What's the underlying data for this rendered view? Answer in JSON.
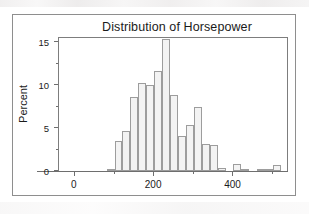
{
  "chart_data": {
    "type": "bar",
    "title": "Distribution of Horsepower",
    "xlabel": "",
    "ylabel": "Percent",
    "ylim": [
      0,
      15.6
    ],
    "xlim": [
      -40,
      540
    ],
    "grid": false,
    "legend": null,
    "y_ticks": [
      0,
      5,
      10,
      15
    ],
    "y_tick_labels": [
      "0",
      "5",
      "10",
      "15"
    ],
    "y_minor_ticks": [
      2.5,
      7.5,
      12.5
    ],
    "x_ticks": [
      0,
      200,
      400
    ],
    "x_tick_labels": [
      "0",
      "200",
      "400"
    ],
    "x_minor_ticks": [
      100,
      300,
      500
    ],
    "bin_width": 20,
    "bin_centers": [
      90,
      110,
      130,
      150,
      170,
      190,
      210,
      230,
      250,
      270,
      290,
      310,
      330,
      350,
      370,
      390,
      410,
      430,
      450,
      470,
      490,
      510
    ],
    "categories": [
      "90",
      "110",
      "130",
      "150",
      "170",
      "190",
      "210",
      "230",
      "250",
      "270",
      "290",
      "310",
      "330",
      "350",
      "370",
      "390",
      "410",
      "430",
      "450",
      "470",
      "490",
      "510"
    ],
    "values": [
      0.2,
      3.5,
      4.7,
      8.6,
      10.3,
      10.0,
      11.6,
      15.4,
      8.8,
      4.1,
      5.3,
      7.5,
      3.2,
      3.0,
      0.4,
      0.0,
      0.8,
      0.1,
      0.0,
      0.2,
      0.1,
      0.7
    ],
    "bar_fill_color": "#f3f3f3",
    "bar_edge_color": "#9d9d9d",
    "axis_color": "#7d7d7d",
    "text_color": "#1b1b1b",
    "background_color": "#ffffff"
  },
  "frame": {
    "border_color": "#8e8e8e"
  }
}
